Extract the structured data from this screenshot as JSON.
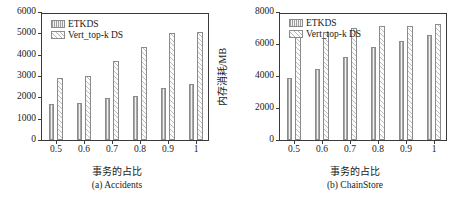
{
  "figure": {
    "panels": [
      {
        "key": "a",
        "caption": "(a) Accidents",
        "xlabel": "事务的占比",
        "ylabel": "内存消耗/MB",
        "ylim": [
          0,
          6000
        ],
        "yticks": [
          0,
          1000,
          2000,
          3000,
          4000,
          5000,
          6000
        ],
        "ytick_labels": [
          "0",
          "1000",
          "2000",
          "3000",
          "4000",
          "5000",
          "6000"
        ],
        "categories": [
          "0.5",
          "0.6",
          "0.7",
          "0.8",
          "0.9",
          "1"
        ],
        "legend": [
          "ETKDS",
          "Vert_top-k DS"
        ],
        "series": [
          {
            "name": "ETKDS",
            "values": [
              1680,
              1750,
              1950,
              2050,
              2420,
              2620
            ]
          },
          {
            "name": "Vert_top-k DS",
            "values": [
              2930,
              2980,
              3690,
              4350,
              5000,
              5050
            ]
          }
        ]
      },
      {
        "key": "b",
        "caption": "(b) ChainStore",
        "xlabel": "事务的占比",
        "ylabel": "内存消耗/MB",
        "ylim": [
          0,
          8000
        ],
        "yticks": [
          0,
          2000,
          4000,
          6000,
          8000
        ],
        "ytick_labels": [
          "0",
          "2000",
          "4000",
          "6000",
          "8000"
        ],
        "categories": [
          "0.5",
          "0.6",
          "0.7",
          "0.8",
          "0.9",
          "1"
        ],
        "legend": [
          "ETKDS",
          "Vert_top-k DS"
        ],
        "series": [
          {
            "name": "ETKDS",
            "values": [
              3900,
              4450,
              5180,
              5800,
              6190,
              6550
            ]
          },
          {
            "name": "Vert_top-k DS",
            "values": [
              6500,
              6750,
              6980,
              7150,
              7150,
              7280
            ]
          }
        ]
      }
    ]
  },
  "chart_data": {
    "type": "bar",
    "title": "",
    "panels": [
      {
        "title": "(a) Accidents",
        "xlabel": "事务的占比",
        "ylabel": "内存消耗/MB",
        "categories": [
          "0.5",
          "0.6",
          "0.7",
          "0.8",
          "0.9",
          "1"
        ],
        "ylim": [
          0,
          6000
        ],
        "yticks": [
          0,
          1000,
          2000,
          3000,
          4000,
          5000,
          6000
        ],
        "grid": false,
        "legend_position": "upper-left",
        "series": [
          {
            "name": "ETKDS",
            "values": [
              1680,
              1750,
              1950,
              2050,
              2420,
              2620
            ]
          },
          {
            "name": "Vert_top-k DS",
            "values": [
              2930,
              2980,
              3690,
              4350,
              5000,
              5050
            ]
          }
        ]
      },
      {
        "title": "(b) ChainStore",
        "xlabel": "事务的占比",
        "ylabel": "内存消耗/MB",
        "categories": [
          "0.5",
          "0.6",
          "0.7",
          "0.8",
          "0.9",
          "1"
        ],
        "ylim": [
          0,
          8000
        ],
        "yticks": [
          0,
          2000,
          4000,
          6000,
          8000
        ],
        "grid": false,
        "legend_position": "upper-left",
        "series": [
          {
            "name": "ETKDS",
            "values": [
              3900,
              4450,
              5180,
              5800,
              6190,
              6550
            ]
          },
          {
            "name": "Vert_top-k DS",
            "values": [
              6500,
              6750,
              6980,
              7150,
              7150,
              7280
            ]
          }
        ]
      }
    ]
  }
}
